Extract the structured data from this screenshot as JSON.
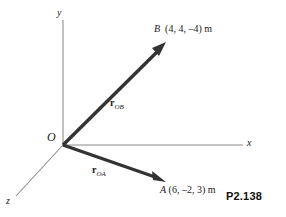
{
  "figure": {
    "number": "P2.138",
    "background_color": "#ffffff",
    "axis_color": "#8c8c8c",
    "vector_color": "#333333",
    "text_color": "#1a1a1a"
  },
  "axes": [
    {
      "id": "y",
      "label": "y",
      "direction": "up"
    },
    {
      "id": "x",
      "label": "x",
      "direction": "right"
    },
    {
      "id": "z",
      "label": "z",
      "direction": "down-left"
    }
  ],
  "origin": {
    "label": "O"
  },
  "points": [
    {
      "id": "B",
      "name": "B",
      "coords_text": "(4, 4, –4) m",
      "x": 4,
      "y": 4,
      "z": -4,
      "units": "m"
    },
    {
      "id": "A",
      "name": "A",
      "coords_text": "(6, –2, 3) m",
      "x": 6,
      "y": -2,
      "z": 3,
      "units": "m"
    }
  ],
  "vectors": [
    {
      "id": "rOB",
      "symbol": "r",
      "subscript": "OB",
      "from": "O",
      "to": "B"
    },
    {
      "id": "rOA",
      "symbol": "r",
      "subscript": "OA",
      "from": "O",
      "to": "A"
    }
  ]
}
